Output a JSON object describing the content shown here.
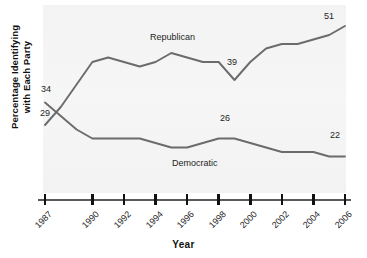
{
  "chart_data": {
    "type": "line",
    "title": "",
    "xlabel": "Year",
    "ylabel_line1": "Percentage Identifying",
    "ylabel_line2": "with Each Party",
    "xtick_labels": [
      "1987",
      "1990",
      "1992",
      "1994",
      "1996",
      "1998",
      "2000",
      "2002",
      "2004",
      "2006"
    ],
    "xlim": [
      1987,
      2006
    ],
    "ylim": [
      15,
      55
    ],
    "grid": false,
    "legend_position": "inline-on-series",
    "line_color": "#6b6b6b",
    "panel_color": "#f4f4f4",
    "series": [
      {
        "name": "Republican",
        "label": "Republican",
        "label_x": 1995.2,
        "x": [
          1987,
          1988,
          1989,
          1990,
          1991,
          1992,
          1993,
          1994,
          1995,
          1996,
          1997,
          1998,
          1999,
          2000,
          2001,
          2002,
          2003,
          2004,
          2005,
          2006
        ],
        "values": [
          29,
          33,
          38,
          43,
          44,
          43,
          42,
          43,
          45,
          44,
          43,
          43,
          39,
          43,
          46,
          47,
          47,
          48,
          49,
          51
        ],
        "annotations": [
          {
            "label": "29",
            "x": 1987,
            "value": 29
          },
          {
            "label": "39",
            "x": 1999,
            "value": 39
          },
          {
            "label": "51",
            "x": 2006,
            "value": 51
          }
        ]
      },
      {
        "name": "Democratic",
        "label": "Democratic",
        "label_x": 1996.8,
        "x": [
          1987,
          1988,
          1989,
          1990,
          1991,
          1992,
          1993,
          1994,
          1995,
          1996,
          1997,
          1998,
          1999,
          2000,
          2001,
          2002,
          2003,
          2004,
          2005,
          2006
        ],
        "values": [
          34,
          31,
          28,
          26,
          26,
          26,
          26,
          25,
          24,
          24,
          25,
          26,
          26,
          25,
          24,
          23,
          23,
          23,
          22,
          22
        ],
        "annotations": [
          {
            "label": "34",
            "x": 1987,
            "value": 34
          },
          {
            "label": "26",
            "x": 1999,
            "value": 26
          },
          {
            "label": "22",
            "x": 2006,
            "value": 22
          }
        ]
      }
    ]
  }
}
